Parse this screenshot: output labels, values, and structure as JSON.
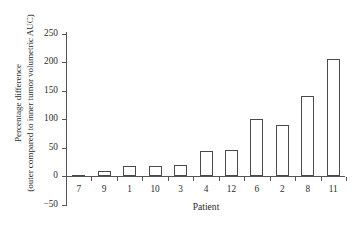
{
  "chart_data": {
    "type": "bar",
    "title": "",
    "xlabel": "Patient",
    "ylabel_lines": [
      "Percentage difference",
      "(outer compared to inner tumor volumetric AUC)"
    ],
    "ylabel": "Percentage difference (outer compared to inner tumor volumetric AUC)",
    "categories": [
      "7",
      "9",
      "1",
      "10",
      "3",
      "4",
      "12",
      "6",
      "2",
      "8",
      "11"
    ],
    "values": [
      1,
      8,
      18,
      18,
      20,
      43,
      45,
      100,
      90,
      140,
      205
    ],
    "ylim": [
      -50,
      250
    ],
    "yticks": [
      -50,
      0,
      50,
      100,
      150,
      200,
      250
    ],
    "ytick_labels": [
      "−50",
      "0",
      "50",
      "100",
      "150",
      "200",
      "250"
    ],
    "grid": false,
    "legend": "none",
    "bar_fill": "#ffffff",
    "bar_edge": "#4a4a4a",
    "axis_color": "#555555",
    "background": "#ffffff"
  }
}
